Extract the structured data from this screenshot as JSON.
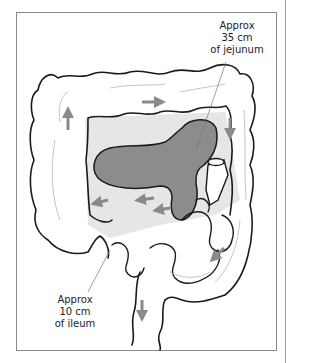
{
  "figure": {
    "type": "anatomical-illustration",
    "colors": {
      "outline": "#1a1a1a",
      "jejunum_fill": "#8c8c8c",
      "background_fill": "#e6e6e6",
      "arrow": "#8a8a8a",
      "frame_border": "#8a8a8a"
    },
    "labels": {
      "jejunum": {
        "line1": "Approx",
        "line2": "35 cm",
        "line3": "of jejunum"
      },
      "ileum": {
        "line1": "Approx",
        "line2": "10 cm",
        "line3": "of ileum"
      }
    },
    "arrows": [
      {
        "name": "ascending-colon-arrow",
        "direction": "up"
      },
      {
        "name": "transverse-colon-arrow",
        "direction": "right"
      },
      {
        "name": "descending-colon-arrow",
        "direction": "down"
      },
      {
        "name": "sigmoid-arrow",
        "direction": "down-left"
      },
      {
        "name": "rectum-arrow",
        "direction": "down"
      },
      {
        "name": "ileum-arrow-left",
        "direction": "left"
      },
      {
        "name": "ileum-arrow-mid",
        "direction": "left"
      },
      {
        "name": "ileum-arrow-inner",
        "direction": "left"
      }
    ]
  }
}
